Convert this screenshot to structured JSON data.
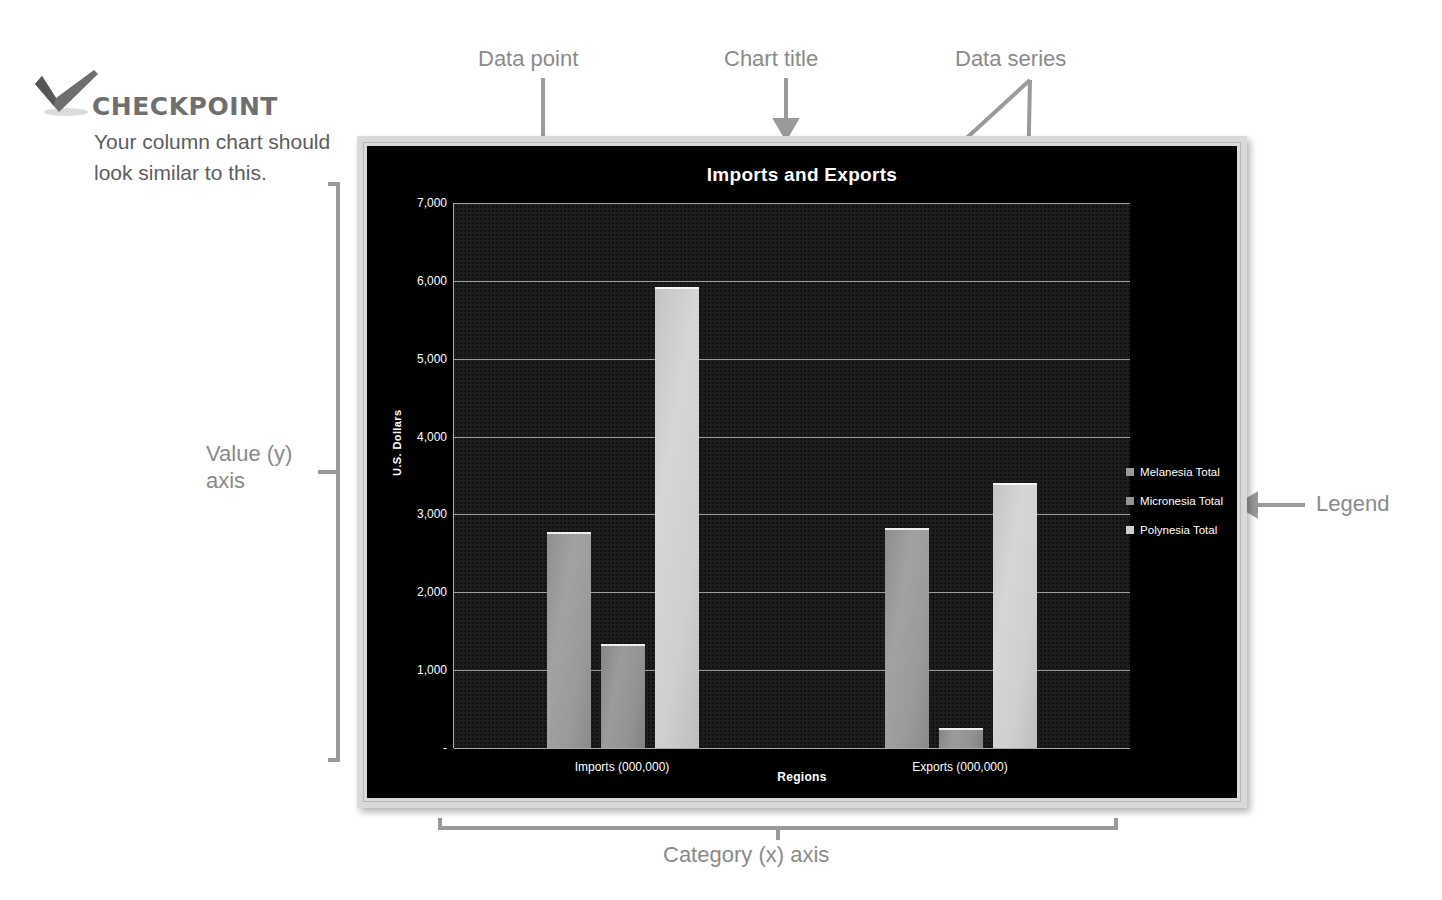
{
  "checkpoint": {
    "icon": "checkmark-icon",
    "title": "CHECKPOINT",
    "body": "Your column chart should look similar to this."
  },
  "annotations": {
    "data_point": "Data point",
    "chart_title": "Chart title",
    "data_series": "Data series",
    "value_axis": "Value (y) axis",
    "legend": "Legend",
    "category_axis": "Category (x) axis"
  },
  "colors": {
    "chart_background": "#000000",
    "plot_background": "#1c1c1c",
    "gridline": "#9d9d9d",
    "text": "#ffffff",
    "annotation": "#8a8a8a",
    "frame": "#d9d9d9",
    "series_melanesia": "#9a9a9a",
    "series_micronesia": "#939393",
    "series_polynesia": "#cfcfcf"
  },
  "chart_data": {
    "type": "bar",
    "title": "Imports and Exports",
    "xlabel": "Regions",
    "ylabel": "U.S. Dollars",
    "categories": [
      "Imports (000,000)",
      "Exports (000,000)"
    ],
    "series": [
      {
        "name": "Melanesia Total",
        "values": [
          2770,
          2820
        ],
        "color": "#9a9a9a"
      },
      {
        "name": "Micronesia Total",
        "values": [
          1330,
          260
        ],
        "color": "#939393"
      },
      {
        "name": "Polynesia Total",
        "values": [
          5920,
          3400
        ],
        "color": "#cfcfcf"
      }
    ],
    "ylim": [
      0,
      7000
    ],
    "yticks": [
      0,
      1000,
      2000,
      3000,
      4000,
      5000,
      6000,
      7000
    ],
    "ytick_labels": [
      "-",
      "1,000",
      "2,000",
      "3,000",
      "4,000",
      "5,000",
      "6,000",
      "7,000"
    ],
    "grid": true,
    "legend_position": "right"
  }
}
